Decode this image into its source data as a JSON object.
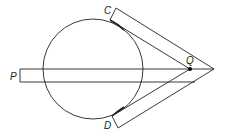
{
  "diagram": {
    "title": "",
    "labels": {
      "C": "C",
      "D": "D",
      "P": "P",
      "Q": "Q"
    },
    "colors": {
      "stroke": "#222222",
      "background": "#ffffff",
      "point": "#000000"
    },
    "circle": {
      "cx": 93,
      "cy": 69,
      "r": 50
    },
    "vertex": {
      "x": 214,
      "y": 69
    },
    "point_Q": {
      "x": 190,
      "y": 69
    },
    "strips": [
      {
        "name": "upper-strip",
        "from_label": "C"
      },
      {
        "name": "lower-strip",
        "from_label": "D"
      },
      {
        "name": "horizontal-strip",
        "from_label": "P"
      }
    ]
  }
}
